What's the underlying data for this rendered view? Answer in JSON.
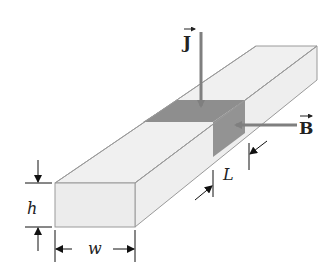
{
  "diagram": {
    "colors": {
      "face_light": "#efefef",
      "face_front": "#ececec",
      "edge": "#9a9a9a",
      "shaded_region": "#8e8e8e",
      "vector_arrow": "#7f7f7f",
      "dimension": "#111111"
    },
    "labels": {
      "current_density": "J",
      "magnetic_field": "B",
      "height": "h",
      "width": "w",
      "length": "L"
    }
  }
}
